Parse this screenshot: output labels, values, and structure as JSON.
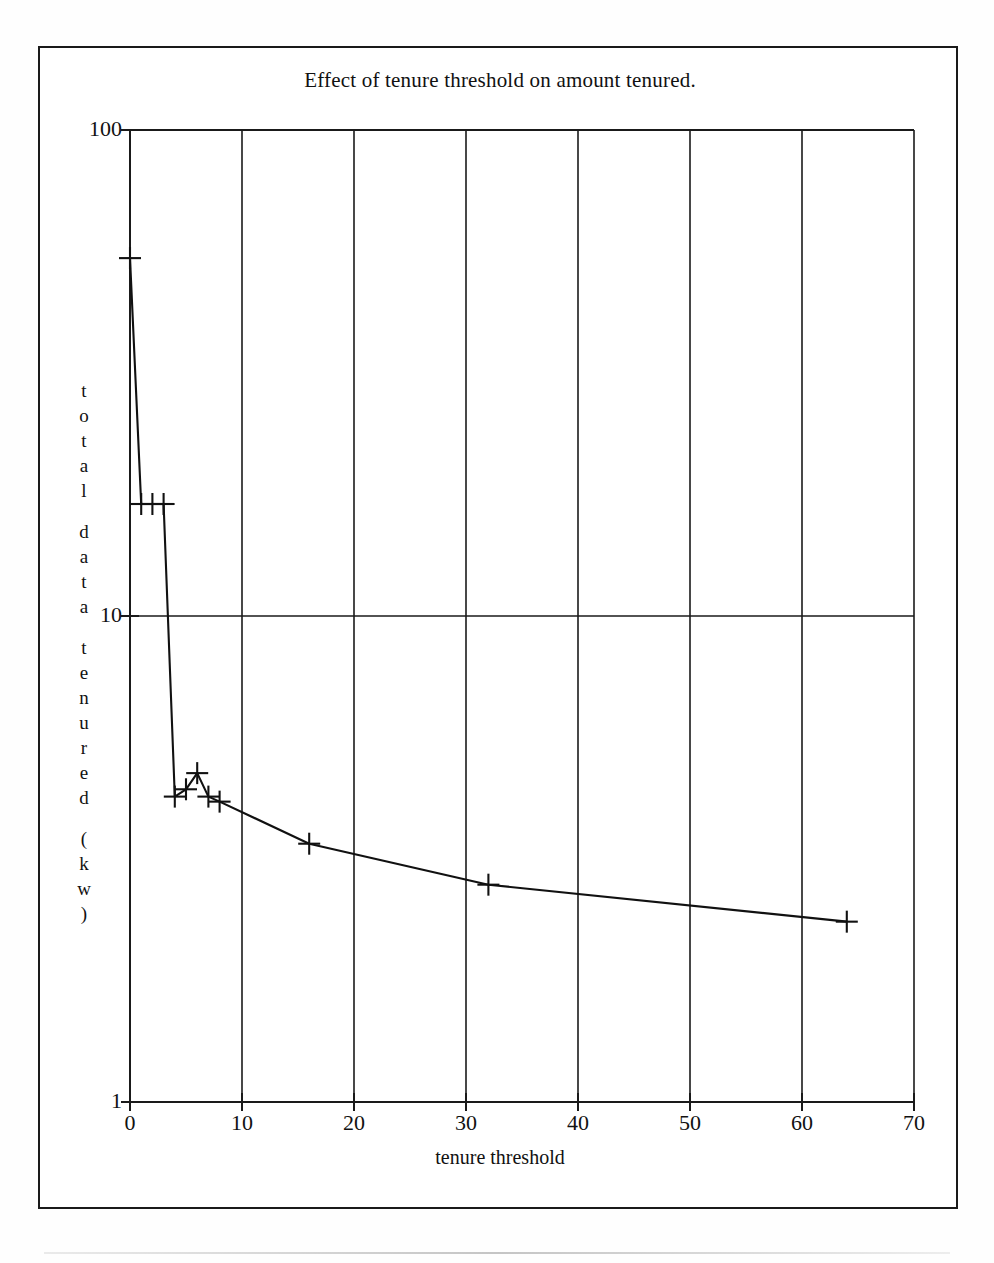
{
  "figure": {
    "title": "Effect of tenure threshold on amount tenured."
  },
  "chart_data": {
    "type": "line",
    "title": "Effect of tenure threshold on amount tenured.",
    "xlabel": "tenure threshold",
    "ylabel": "total data tenured (kw)",
    "ylabel_stacked": [
      "t",
      "o",
      "t",
      "a",
      "l",
      "",
      "d",
      "a",
      "t",
      "a",
      "",
      "t",
      "e",
      "n",
      "u",
      "r",
      "e",
      "d",
      "",
      "(",
      "k",
      "w",
      ")"
    ],
    "xscale": "linear",
    "yscale": "log",
    "xlim": [
      0,
      70
    ],
    "ylim": [
      1,
      100
    ],
    "xticks": [
      0,
      10,
      20,
      30,
      40,
      50,
      60,
      70
    ],
    "xtick_labels": [
      "0",
      "10",
      "20",
      "30",
      "40",
      "50",
      "60",
      "70"
    ],
    "yticks": [
      1,
      10,
      100
    ],
    "ytick_labels": [
      "1",
      "10",
      "100"
    ],
    "grid": true,
    "grid_axis": "both",
    "marker": "plus",
    "legend": false,
    "series": [
      {
        "name": "total data tenured",
        "x": [
          0,
          1,
          2,
          3,
          4,
          5,
          6,
          7,
          8,
          16,
          32,
          64
        ],
        "y": [
          54.5,
          17.0,
          17.0,
          17.0,
          4.25,
          4.4,
          4.75,
          4.25,
          4.15,
          3.4,
          2.8,
          2.35
        ]
      }
    ]
  }
}
